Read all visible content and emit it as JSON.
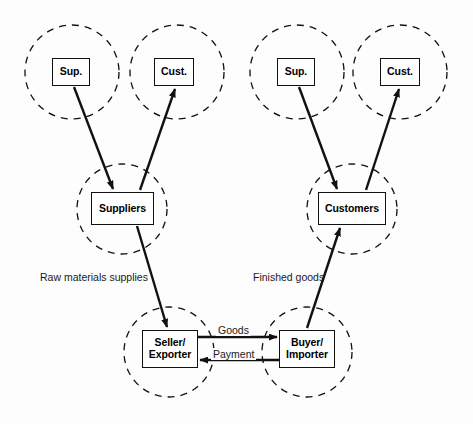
{
  "diagram": {
    "background_color": "#fdfdfd",
    "line_color": "#111111",
    "box_fill": "#ffffff",
    "nodes": [
      {
        "id": "sup_left",
        "label": "Sup.",
        "x": 52,
        "y": 58,
        "w": 38,
        "h": 28
      },
      {
        "id": "cust_left",
        "label": "Cust.",
        "x": 154,
        "y": 58,
        "w": 40,
        "h": 28
      },
      {
        "id": "suppliers",
        "label": "Suppliers",
        "x": 91,
        "y": 192,
        "w": 63,
        "h": 33
      },
      {
        "id": "seller",
        "label_line1": "Seller/",
        "label_line2": "Exporter",
        "x": 142,
        "y": 330,
        "w": 56,
        "h": 38
      },
      {
        "id": "buyer",
        "label_line1": "Buyer/",
        "label_line2": "Importer",
        "x": 279,
        "y": 330,
        "w": 56,
        "h": 38
      },
      {
        "id": "customers",
        "label": "Customers",
        "x": 318,
        "y": 192,
        "w": 68,
        "h": 33
      },
      {
        "id": "sup_right",
        "label": "Sup.",
        "x": 277,
        "y": 58,
        "w": 38,
        "h": 28
      },
      {
        "id": "cust_right",
        "label": "Cust.",
        "x": 380,
        "y": 58,
        "w": 40,
        "h": 28
      }
    ],
    "circles": [
      {
        "id": "circle_sup_left",
        "cx": 72,
        "cy": 72,
        "r": 47
      },
      {
        "id": "circle_cust_left",
        "cx": 177,
        "cy": 72,
        "r": 47
      },
      {
        "id": "circle_suppliers",
        "cx": 122,
        "cy": 209,
        "r": 45
      },
      {
        "id": "circle_seller",
        "cx": 169,
        "cy": 352,
        "r": 45
      },
      {
        "id": "circle_buyer",
        "cx": 307,
        "cy": 352,
        "r": 45
      },
      {
        "id": "circle_customers",
        "cx": 352,
        "cy": 209,
        "r": 45
      },
      {
        "id": "circle_sup_right",
        "cx": 297,
        "cy": 72,
        "r": 47
      },
      {
        "id": "circle_cust_right",
        "cx": 400,
        "cy": 72,
        "r": 47
      }
    ],
    "edge_labels": [
      {
        "id": "raw_materials_supplies",
        "text": "Raw materials supplies",
        "x": 40,
        "y": 271
      },
      {
        "id": "finished_goods",
        "text": "Finished goods",
        "x": 253,
        "y": 271
      },
      {
        "id": "goods",
        "text": "Goods",
        "x": 216,
        "y": 324
      },
      {
        "id": "payment",
        "text": "Payment",
        "x": 211,
        "y": 348
      }
    ],
    "arrows": [
      {
        "id": "sup_left_to_suppliers",
        "from": "sup_left",
        "to": "suppliers",
        "direction": "down-right"
      },
      {
        "id": "suppliers_to_cust_left",
        "from": "suppliers",
        "to": "cust_left",
        "direction": "up-right"
      },
      {
        "id": "suppliers_to_seller",
        "from": "suppliers",
        "to": "seller",
        "direction": "down-right"
      },
      {
        "id": "seller_to_buyer_goods",
        "from": "seller",
        "to": "buyer",
        "direction": "right"
      },
      {
        "id": "buyer_to_seller_payment",
        "from": "buyer",
        "to": "seller",
        "direction": "left"
      },
      {
        "id": "buyer_to_customers",
        "from": "buyer",
        "to": "customers",
        "direction": "up-right"
      },
      {
        "id": "sup_right_to_customers",
        "from": "sup_right",
        "to": "customers",
        "direction": "down-right"
      },
      {
        "id": "customers_to_cust_right",
        "from": "customers",
        "to": "cust_right",
        "direction": "up-right"
      }
    ]
  }
}
